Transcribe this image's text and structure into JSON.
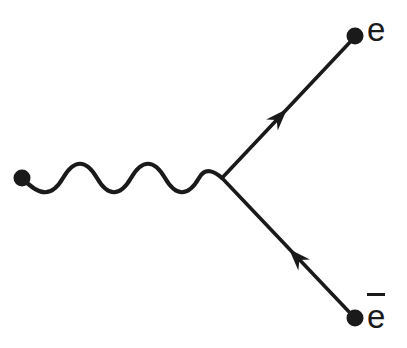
{
  "diagram": {
    "background_color": "#ffffff",
    "ink_color": "#1a1a1a",
    "stroke_width": 4,
    "vertex": {
      "x": 222,
      "y": 178
    },
    "photon_line": {
      "type": "wavy",
      "start": {
        "x": 22,
        "y": 178
      },
      "end": {
        "x": 222,
        "y": 178
      },
      "cycles": 3,
      "amplitude": 15,
      "path": "M 22 178 C 40 196, 52 196, 63 178 C 74 160, 86 160, 97 178 C 108 196, 120 196, 131 178 C 142 160, 154 160, 165 178 C 176 196, 188 196, 199 178 C 206 166, 214 170, 222 178"
    },
    "fermion_lines": [
      {
        "name": "electron-line",
        "from": {
          "x": 222,
          "y": 178
        },
        "to": {
          "x": 352,
          "y": 40
        },
        "arrow_at": {
          "x": 287,
          "y": 109
        },
        "arrow_direction": "up-right"
      },
      {
        "name": "positron-line",
        "from": {
          "x": 222,
          "y": 178
        },
        "to": {
          "x": 352,
          "y": 315
        },
        "arrow_at": {
          "x": 289,
          "y": 249
        },
        "arrow_direction": "up-left"
      }
    ],
    "dots": [
      {
        "name": "photon-source-dot",
        "x": 22,
        "y": 178,
        "r": 8
      },
      {
        "name": "electron-endpoint-dot",
        "x": 355,
        "y": 36,
        "r": 8
      },
      {
        "name": "positron-endpoint-dot",
        "x": 355,
        "y": 318,
        "r": 8
      }
    ],
    "labels": {
      "electron": "e",
      "positron": "e",
      "positron_has_overbar": true
    }
  }
}
